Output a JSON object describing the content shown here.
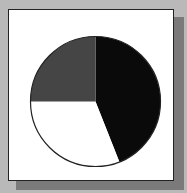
{
  "chart_data": {
    "type": "pie",
    "title": "",
    "start_angle_deg": 0,
    "direction": "clockwise",
    "slices": [
      {
        "label": "",
        "value": 44,
        "color": "#0a0a0a"
      },
      {
        "label": "",
        "value": 31,
        "color": "#ffffff"
      },
      {
        "label": "",
        "value": 25,
        "color": "#454545"
      }
    ],
    "legend": "none"
  },
  "frame": {
    "background": "#b9b9b9",
    "panel": "#ffffff",
    "shadow": "#7a7a7a",
    "border": "#222222"
  }
}
